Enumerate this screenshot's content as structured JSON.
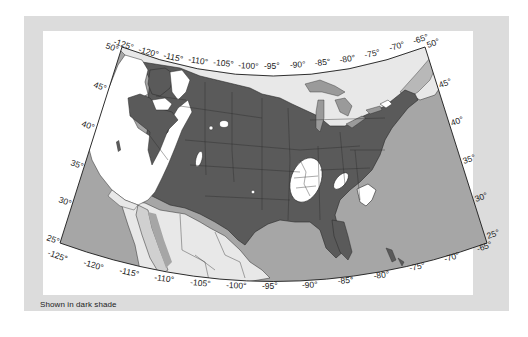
{
  "figure": {
    "caption": "Shown in dark shade"
  },
  "map": {
    "projection": "conic",
    "extent": {
      "lon_min": -125,
      "lon_max": -65,
      "lat_min": 25,
      "lat_max": 50
    },
    "colors": {
      "frame": "#dcdcdc",
      "panel": "#ffffff",
      "ocean": "#a6a6a6",
      "dark_shade_region": "#5a5a5a",
      "other_land": "#e8e8e8",
      "excluded_white": "#ffffff",
      "lakes": "#9a9a9a",
      "borders": "#2a2a2a"
    },
    "top_lon_labels": [
      "-125°",
      "-120°",
      "-115°",
      "-110°",
      "-105°",
      "-100°",
      "-95°",
      "-90°",
      "-85°",
      "-80°",
      "-75°",
      "-70°",
      "-65°"
    ],
    "bottom_lon_labels": [
      "-125°",
      "-120°",
      "-115°",
      "-110°",
      "-105°",
      "-100°",
      "-95°",
      "-90°",
      "-85°",
      "-80°",
      "-75°",
      "-70°",
      "-65°"
    ],
    "left_lat_labels": [
      "50°",
      "45°",
      "40°",
      "35°",
      "30°",
      "25°"
    ],
    "right_lat_labels": [
      "50°",
      "45°",
      "40°",
      "35°",
      "30°",
      "25°"
    ],
    "legend_meaning": "Dark shade = region of interest (most of central and eastern United States)"
  }
}
